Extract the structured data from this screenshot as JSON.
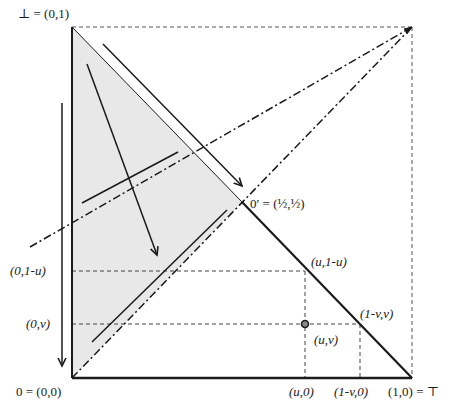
{
  "diagram": {
    "title": "",
    "colors": {
      "stroke": "#1a1a1a",
      "shade": "#e6e6e6",
      "dashed": "#444444"
    },
    "labels": {
      "bottom_elem": "⊥ = (0,1)",
      "zero": "0 = (0,0)",
      "top_elem": "(1,0) = ⊤",
      "zero_prime": "0′ = (½,½)",
      "u_1mu": "(u,1-u)",
      "zero_1mu": "(0,1-u)",
      "zero_v": "(0,v)",
      "1mv_v": "(1-v,v)",
      "u_v": "(u,v)",
      "u_0": "(u,0)",
      "1mv_0": "(1-v,0)"
    },
    "params": {
      "u": 0.7,
      "v": 0.16
    }
  }
}
